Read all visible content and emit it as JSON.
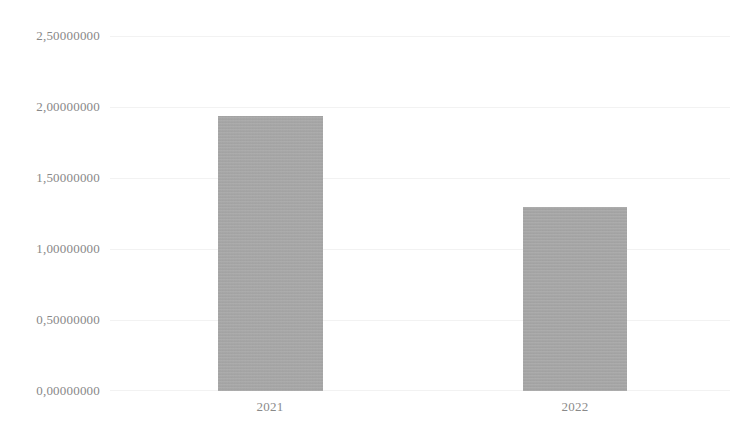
{
  "chart_data": {
    "type": "bar",
    "title": "",
    "subtitle": "",
    "xlabel": "",
    "ylabel": "",
    "categories": [
      "2021",
      "2022"
    ],
    "values": [
      1.94,
      1.3
    ],
    "series": [
      {
        "name": "",
        "values": [
          1.94,
          1.3
        ]
      }
    ],
    "ylim": [
      0,
      2.5
    ],
    "y_ticks": [
      0,
      0.5,
      1.0,
      1.5,
      2.0,
      2.5
    ],
    "y_tick_labels": [
      "0,00000000",
      "0,50000000",
      "1,00000000",
      "1,50000000",
      "2,00000000",
      "2,50000000"
    ],
    "decimal_separator": ",",
    "grid": true,
    "grid_axis": "y",
    "legend": false,
    "legend_position": "none",
    "bar_color": "#a8a8a8",
    "grid_color": "#f2f2f2",
    "tick_label_color": "#888888",
    "background_color": "#ffffff",
    "annotations": []
  }
}
